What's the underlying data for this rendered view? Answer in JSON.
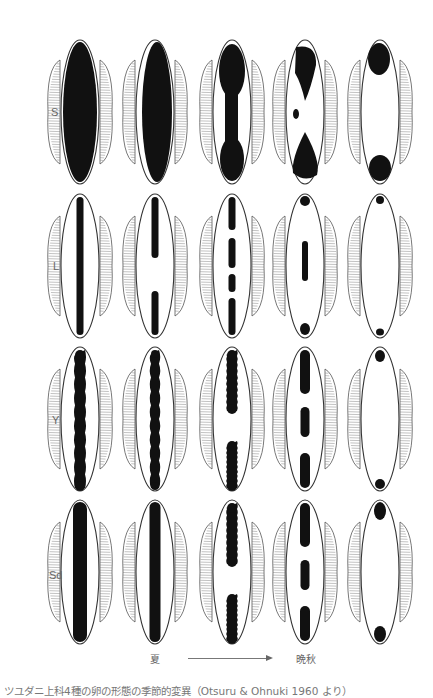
{
  "figure": {
    "rows": [
      {
        "label": "S",
        "label_y": 114,
        "center_y": 112
      },
      {
        "label": "L",
        "label_y": 268,
        "center_y": 266
      },
      {
        "label": "Y",
        "label_y": 422,
        "center_y": 419
      },
      {
        "label": "Sd",
        "label_y": 577,
        "center_y": 572
      }
    ],
    "columns_x": [
      80,
      155,
      232,
      305,
      380
    ],
    "egg": {
      "half_width": 19,
      "half_height": 72,
      "fringe_half_width": 32,
      "fringe_half_height": 46
    },
    "season_axis": {
      "start_label": "夏",
      "end_label": "晩秋",
      "arrow": "right-arrow"
    },
    "caption": "ツユダニ上科4種の卵の形態の季節的変異（Otsuru & Ohnuki 1960 より）",
    "colors": {
      "ink": "#111111",
      "outline": "#333333",
      "fringe": "#555555",
      "background": "#ffffff"
    },
    "patterns": {
      "S": [
        "full",
        "full-narrow",
        "hourglass",
        "broken-x",
        "poles-large"
      ],
      "L": [
        "thin-line",
        "line-gap-center",
        "dashed-4",
        "dots-poles-center",
        "dots-poles"
      ],
      "Y": [
        "wavy-band",
        "wavy-band-narrow",
        "band-gap-center",
        "three-segments",
        "small-poles"
      ],
      "Sd": [
        "thick-band",
        "thick-band-tapered",
        "band-gap-center",
        "three-segments",
        "poles-medium"
      ]
    }
  }
}
